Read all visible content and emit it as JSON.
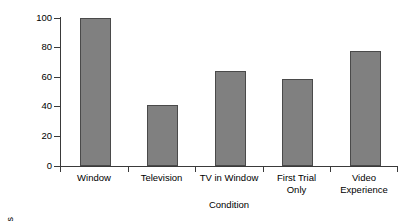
{
  "chart_data": {
    "type": "bar",
    "title": "",
    "xlabel": "Condition",
    "ylabel": "% Errorless Retrievals",
    "categories": [
      "Window",
      "Television",
      "TV in Window",
      "First Trial\nOnly",
      "Video\nExperience"
    ],
    "values": [
      100,
      41,
      64,
      59,
      78
    ],
    "ylim": [
      0,
      100
    ],
    "yticks": [
      0,
      20,
      40,
      60,
      80,
      100
    ],
    "ytick_labels": [
      "0",
      "20",
      "40",
      "60",
      "80",
      "100"
    ],
    "grid": false,
    "legend": false,
    "legend_position": "none",
    "bar_color": "#808080",
    "bar_edge_color": "#4a4a4a",
    "axis_color": "#3a3a3a",
    "background": "#ffffff"
  }
}
